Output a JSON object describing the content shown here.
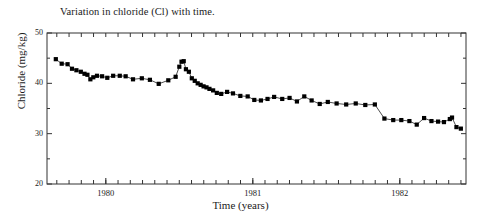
{
  "chart_data": {
    "type": "line",
    "title": "Variation in chloride (Cl) with time.",
    "xlabel": "Time (years)",
    "ylabel": "Chloride (mg/kg)",
    "xlim": [
      1979.6,
      1982.45
    ],
    "ylim": [
      20,
      50
    ],
    "ytick_labels": [
      "50",
      "40",
      "30",
      "20"
    ],
    "ytick_values": [
      50,
      40,
      30,
      20
    ],
    "yminor_values": [
      45,
      35,
      25
    ],
    "xtick_labels": [
      "1980",
      "1981",
      "1982"
    ],
    "xtick_values": [
      1980,
      1981,
      1982
    ],
    "xminor_step_years": 0.0833,
    "grid": false,
    "legend": null,
    "marker": "filled-square",
    "marker_color": "#000000",
    "line_color": "#000000",
    "series": [
      {
        "name": "Chloride (Cl)",
        "x": [
          1979.66,
          1979.7,
          1979.74,
          1979.77,
          1979.8,
          1979.83,
          1979.855,
          1979.875,
          1979.895,
          1979.915,
          1979.94,
          1979.975,
          1980.01,
          1980.05,
          1980.095,
          1980.135,
          1980.185,
          1980.245,
          1980.3,
          1980.36,
          1980.425,
          1980.475,
          1980.5,
          1980.515,
          1980.53,
          1980.545,
          1980.565,
          1980.585,
          1980.605,
          1980.625,
          1980.645,
          1980.665,
          1980.685,
          1980.705,
          1980.73,
          1980.755,
          1980.785,
          1980.825,
          1980.865,
          1980.915,
          1980.965,
          1981.01,
          1981.055,
          1981.1,
          1981.145,
          1981.2,
          1981.25,
          1981.3,
          1981.35,
          1981.4,
          1981.455,
          1981.51,
          1981.57,
          1981.635,
          1981.7,
          1981.765,
          1981.83,
          1981.895,
          1981.955,
          1982.01,
          1982.065,
          1982.115,
          1982.165,
          1982.215,
          1982.26,
          1982.3,
          1982.34
        ],
        "values": [
          44.8,
          43.9,
          43.8,
          42.9,
          42.6,
          42.3,
          41.9,
          41.7,
          40.8,
          41.2,
          41.5,
          41.4,
          41.1,
          41.5,
          41.5,
          41.4,
          40.8,
          41.0,
          40.7,
          39.9,
          40.6,
          41.3,
          43.3,
          44.3,
          44.4,
          42.8,
          42.3,
          41.0,
          40.5,
          40.0,
          39.7,
          39.4,
          39.2,
          38.9,
          38.6,
          38.1,
          37.9,
          38.3,
          38.0,
          37.5,
          37.4,
          36.7,
          36.6,
          36.9,
          37.3,
          36.9,
          37.1,
          36.4,
          37.4,
          36.6,
          35.9,
          36.3,
          36.0,
          35.8,
          36.0,
          35.7,
          35.8,
          33.0,
          32.7,
          32.7,
          32.5,
          31.8,
          33.1,
          32.5,
          32.4,
          32.3,
          32.9
        ]
      },
      {
        "name": "Chloride (Cl) tail",
        "x": [
          1982.37,
          1982.4
        ],
        "values": [
          33.1,
          31.4
        ]
      }
    ],
    "series_tail_extra": {
      "x": [
        1982.355,
        1982.385,
        1982.415
      ],
      "values": [
        33.2,
        31.3,
        31.0,
        30.9
      ]
    }
  }
}
